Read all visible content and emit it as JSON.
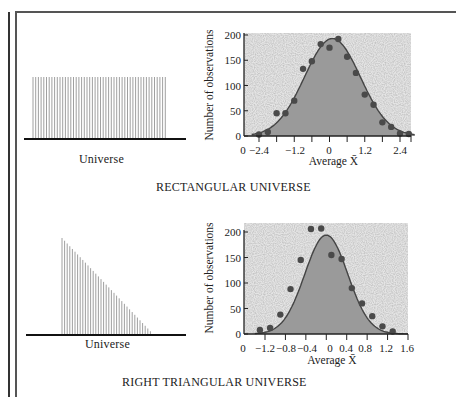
{
  "figure": {
    "panels": [
      {
        "universe_label": "Universe",
        "universe_shape": "rectangular",
        "caption": "RECTANGULAR UNIVERSE"
      },
      {
        "universe_label": "Universe",
        "universe_shape": "right-triangular",
        "caption": "RIGHT TRIANGULAR UNIVERSE"
      }
    ]
  },
  "colors": {
    "fill": "#9a9a9a",
    "stipple_bg": "#e4e4e4",
    "points": "#4a4a4a",
    "curve": "#444444",
    "axis": "#222222"
  },
  "chart_data": [
    {
      "type": "scatter",
      "title": "",
      "subtitle": "Rectangular universe — distribution of sample averages",
      "xlabel": "Average X̄",
      "ylabel": "Number of observations",
      "xlim": [
        -2.7,
        2.9
      ],
      "ylim": [
        0,
        200
      ],
      "x_tick_labels": [
        "0",
        "−2.4",
        "−1.2",
        "0",
        "1.2",
        "2.4"
      ],
      "x_ticks": [
        -2.4,
        -1.8,
        -1.2,
        -0.6,
        0,
        0.6,
        1.2,
        1.8,
        2.4,
        2.9
      ],
      "y_ticks": [
        0,
        50,
        100,
        150,
        200
      ],
      "grid": false,
      "legend": null,
      "series": [
        {
          "name": "observed counts",
          "x": [
            -2.4,
            -2.1,
            -1.8,
            -1.5,
            -1.2,
            -0.9,
            -0.6,
            -0.3,
            0.0,
            0.3,
            0.6,
            0.9,
            1.2,
            1.5,
            1.8,
            2.1,
            2.4,
            2.7
          ],
          "y": [
            3,
            8,
            45,
            45,
            70,
            133,
            148,
            182,
            175,
            192,
            157,
            125,
            82,
            62,
            27,
            18,
            5,
            4
          ]
        },
        {
          "name": "normal curve",
          "kind": "line+area",
          "mean": 0.1,
          "sd": 0.95,
          "peak": 193
        }
      ]
    },
    {
      "type": "scatter",
      "title": "",
      "subtitle": "Right triangular universe — distribution of sample averages",
      "xlabel": "Average X̄",
      "ylabel": "Number of observations",
      "xlim": [
        -1.45,
        1.6
      ],
      "ylim": [
        0,
        200
      ],
      "x_tick_labels": [
        "0",
        "−1.2",
        "−0.8",
        "−0.4",
        "0",
        "0.4",
        "0.8",
        "1.2",
        "1.6"
      ],
      "x_ticks": [
        -1.2,
        -0.8,
        -0.4,
        0,
        0.4,
        0.8,
        1.2,
        1.6
      ],
      "y_ticks": [
        0,
        50,
        100,
        150,
        200
      ],
      "grid": false,
      "legend": null,
      "series": [
        {
          "name": "observed counts",
          "x": [
            -1.3,
            -1.1,
            -0.9,
            -0.7,
            -0.5,
            -0.3,
            -0.1,
            0.1,
            0.3,
            0.5,
            0.7,
            0.9,
            1.1,
            1.3
          ],
          "y": [
            8,
            12,
            38,
            88,
            145,
            206,
            207,
            155,
            147,
            90,
            60,
            35,
            15,
            5
          ]
        },
        {
          "name": "normal curve",
          "kind": "line+area",
          "mean": 0.0,
          "sd": 0.42,
          "peak": 194
        }
      ]
    }
  ]
}
